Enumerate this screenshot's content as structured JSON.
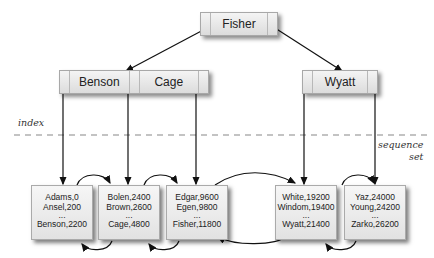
{
  "labels": {
    "index": "index",
    "sequence_set_1": "sequence",
    "sequence_set_2": "set"
  },
  "index": {
    "root": {
      "key": "Fisher"
    },
    "level1": [
      {
        "keys": [
          "Benson",
          "Cage"
        ]
      },
      {
        "keys": [
          "Wyatt"
        ]
      }
    ]
  },
  "sequence_set": [
    {
      "records": [
        "Adams,0",
        "Ansel,200",
        "...",
        "Benson,2200"
      ]
    },
    {
      "records": [
        "Bolen,2400",
        "Brown,2600",
        "...",
        "Cage,4800"
      ]
    },
    {
      "records": [
        "Edgar,9600",
        "Egen,9800",
        "...",
        "Fisher,11800"
      ]
    },
    {
      "records": [
        "White,19200",
        "Windom,19400",
        "...",
        "Wyatt,21400"
      ]
    },
    {
      "records": [
        "Yaz,24000",
        "Young,24200",
        "...",
        "Zarko,26200"
      ]
    }
  ]
}
